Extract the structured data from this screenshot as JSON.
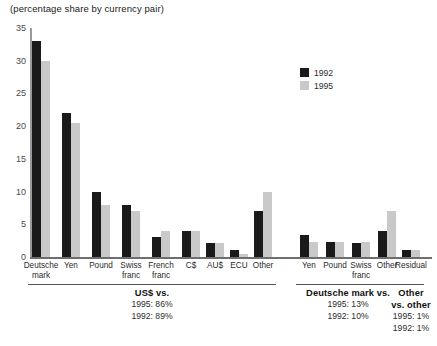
{
  "chart_data": {
    "type": "bar",
    "title": "(percentage share by currency pair)",
    "subtitle": "",
    "xlabel": "",
    "ylabel": "",
    "ylim": [
      0,
      35
    ],
    "yticks": [
      0,
      5,
      10,
      15,
      20,
      25,
      30,
      35
    ],
    "grid": false,
    "legend_position": "upper-right",
    "categories": [
      "Deutsche mark",
      "Yen",
      "Pound",
      "Swiss franc",
      "French franc",
      "C$",
      "AU$",
      "ECU",
      "Other",
      "Yen",
      "Pound",
      "Swiss franc",
      "Other",
      "Residual"
    ],
    "category_lines": [
      [
        "Deutsche",
        "mark"
      ],
      [
        "Yen",
        ""
      ],
      [
        "Pound",
        ""
      ],
      [
        "Swiss",
        "franc"
      ],
      [
        "French",
        "franc"
      ],
      [
        "C$",
        ""
      ],
      [
        "AU$",
        ""
      ],
      [
        "ECU",
        ""
      ],
      [
        "Other",
        ""
      ],
      [
        "Yen",
        ""
      ],
      [
        "Pound",
        ""
      ],
      [
        "Swiss",
        "franc"
      ],
      [
        "Other",
        ""
      ],
      [
        "Residual",
        ""
      ]
    ],
    "series": [
      {
        "name": "1992",
        "color": "#1a1a1a",
        "values": [
          33,
          22,
          10,
          8,
          3,
          4,
          2.2,
          1,
          7,
          3.3,
          2.3,
          2.2,
          4,
          1
        ]
      },
      {
        "name": "1995",
        "color": "#c9c9c9",
        "values": [
          30,
          20.5,
          8,
          7,
          4,
          4,
          2.2,
          0.4,
          10,
          2.3,
          2.3,
          2.3,
          7,
          1
        ]
      }
    ],
    "groups": [
      {
        "id": "usd-vs",
        "title": "US$ vs.",
        "lines": [
          "1995: 86%",
          "1992: 89%"
        ],
        "first_index": 0,
        "last_index": 8
      },
      {
        "id": "dm-vs",
        "title": "Deutsche mark vs.",
        "lines": [
          "1995: 13%",
          "1992: 10%"
        ],
        "first_index": 9,
        "last_index": 12
      },
      {
        "id": "other-vs-other",
        "title": "Other",
        "title2": "vs. other",
        "lines": [
          "1995: 1%",
          "1992: 1%"
        ],
        "first_index": 13,
        "last_index": 13
      }
    ]
  },
  "legend": {
    "entries": [
      {
        "label": "1992",
        "color": "#1a1a1a"
      },
      {
        "label": "1995",
        "color": "#c9c9c9"
      }
    ]
  }
}
